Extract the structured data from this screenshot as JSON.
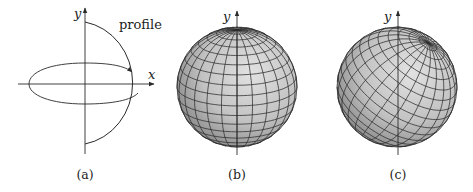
{
  "panels": [
    {
      "id": "a",
      "caption": "(a)",
      "axis_y_label": "y",
      "axis_x_label": "x",
      "curve_label": "profile",
      "description": "Semicircular profile curve in the xy-plane rotated about the y-axis; elliptical arrow indicates revolution"
    },
    {
      "id": "b",
      "caption": "(b)",
      "axis_y_label": "y",
      "description": "Sphere of revolution with parameter grid aligned to y-axis (pole at top)"
    },
    {
      "id": "c",
      "caption": "(c)",
      "axis_y_label": "y",
      "description": "Sphere with parameter grid tilted (pole rotated toward upper right)"
    }
  ],
  "colors": {
    "line": "#2a2a2a",
    "sphere_light": "#dedede",
    "sphere_mid": "#bdbdbd",
    "sphere_dark": "#7a7a7a",
    "grid": "#2b2b2b"
  },
  "sphere_grid": {
    "meridians": 24,
    "parallels": 18
  }
}
